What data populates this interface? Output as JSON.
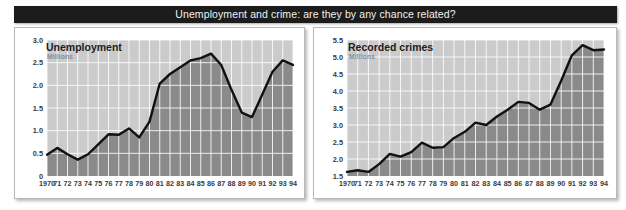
{
  "banner": {
    "text": "Unemployment and crime: are they by any chance related?"
  },
  "colors": {
    "banner_bg": "#1c1c1c",
    "banner_text": "#f2f0ec",
    "panel_bg": "#ffffff",
    "panel_border": "#b9b9b9",
    "plot_upper": "#cbcbcb",
    "plot_fill": "#8a8a8a",
    "gridline": "#ffffff",
    "series_line": "#111111",
    "tick_text": "#3a3a3a",
    "subtitle_text": "#8d8d8d"
  },
  "charts": [
    {
      "id": "unemployment",
      "title": "Unemployment",
      "subtitle": "Millions"
    },
    {
      "id": "recorded-crimes",
      "title": "Recorded crimes",
      "subtitle": "Millions"
    }
  ],
  "chart_data": [
    {
      "type": "area",
      "id": "unemployment",
      "title": "Unemployment",
      "subtitle": "Millions",
      "xlabel": "",
      "ylabel": "Millions",
      "grid": true,
      "legend": "none",
      "xlim": [
        1970,
        1994
      ],
      "ylim": [
        0,
        3.0
      ],
      "ytick_labels": [
        "3.0",
        "2.5",
        "2.0",
        "1.5",
        "1.0",
        "0.5",
        "0"
      ],
      "yticks": [
        3.0,
        2.5,
        2.0,
        1.5,
        1.0,
        0.5,
        0
      ],
      "xtick_labels": [
        "1970",
        "71",
        "72",
        "73",
        "74",
        "75",
        "76",
        "77",
        "78",
        "79",
        "80",
        "81",
        "82",
        "83",
        "84",
        "85",
        "86",
        "87",
        "88",
        "89",
        "90",
        "91",
        "92",
        "93",
        "94"
      ],
      "x": [
        1970,
        1971,
        1972,
        1973,
        1974,
        1975,
        1976,
        1977,
        1978,
        1979,
        1980,
        1981,
        1982,
        1983,
        1984,
        1985,
        1986,
        1987,
        1988,
        1989,
        1990,
        1991,
        1992,
        1993,
        1994
      ],
      "values": [
        0.47,
        0.62,
        0.48,
        0.36,
        0.48,
        0.7,
        0.92,
        0.91,
        1.05,
        0.85,
        1.2,
        2.04,
        2.25,
        2.4,
        2.55,
        2.6,
        2.7,
        2.45,
        1.9,
        1.4,
        1.3,
        1.8,
        2.3,
        2.55,
        2.45
      ]
    },
    {
      "type": "area",
      "id": "recorded-crimes",
      "title": "Recorded crimes",
      "subtitle": "Millions",
      "xlabel": "",
      "ylabel": "Millions",
      "grid": true,
      "legend": "none",
      "xlim": [
        1970,
        1994
      ],
      "ylim": [
        1.5,
        5.5
      ],
      "ytick_labels": [
        "5.5",
        "5.0",
        "4.5",
        "4.0",
        "3.5",
        "3.0",
        "2.5",
        "2.0",
        "1.5"
      ],
      "yticks": [
        5.5,
        5.0,
        4.5,
        4.0,
        3.5,
        3.0,
        2.5,
        2.0,
        1.5
      ],
      "xtick_labels": [
        "1970",
        "71",
        "72",
        "73",
        "74",
        "75",
        "76",
        "77",
        "78",
        "79",
        "80",
        "81",
        "82",
        "83",
        "84",
        "85",
        "86",
        "87",
        "88",
        "89",
        "90",
        "91",
        "92",
        "93",
        "94"
      ],
      "x": [
        1970,
        1971,
        1972,
        1973,
        1974,
        1975,
        1976,
        1977,
        1978,
        1979,
        1980,
        1981,
        1982,
        1983,
        1984,
        1985,
        1986,
        1987,
        1988,
        1989,
        1990,
        1991,
        1992,
        1993,
        1994
      ],
      "values": [
        1.62,
        1.67,
        1.62,
        1.85,
        2.15,
        2.07,
        2.2,
        2.48,
        2.33,
        2.35,
        2.62,
        2.8,
        3.07,
        3.0,
        3.25,
        3.45,
        3.68,
        3.65,
        3.45,
        3.6,
        4.3,
        5.05,
        5.35,
        5.2,
        5.22
      ]
    }
  ]
}
